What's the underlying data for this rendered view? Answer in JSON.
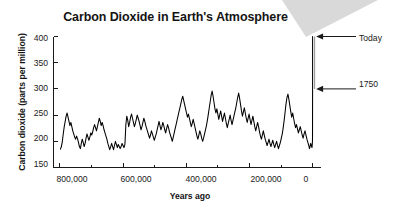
{
  "figure": {
    "background_color": "#ffffff",
    "title": "Carbon Dioxide in Earth's Atmosphere",
    "wedge_color": "#d9d9d9"
  },
  "annotations": [
    {
      "name": "today",
      "label": "Today",
      "value_ppm": 400,
      "years_ago": 0
    },
    {
      "name": "1750",
      "label": "1750",
      "value_ppm": 300,
      "years_ago": 0
    }
  ],
  "chart_data": {
    "type": "line",
    "title": "Carbon Dioxide in Earth's Atmosphere",
    "xlabel": "Years ago",
    "ylabel": "Carbon dioxide (parts per million)",
    "xlim": [
      820000,
      -25000
    ],
    "ylim": [
      150,
      400
    ],
    "x_reversed": true,
    "grid": false,
    "legend": null,
    "yticks": [
      150,
      200,
      250,
      300,
      350,
      400
    ],
    "ytick_labels": [
      "150",
      "200",
      "250",
      "300",
      "350",
      "400"
    ],
    "xticks": [
      800000,
      700000,
      600000,
      500000,
      400000,
      300000,
      200000,
      100000,
      0
    ],
    "xtick_labels": [
      "800,000",
      "",
      "600,000",
      "",
      "400,000",
      "",
      "200,000",
      "",
      "0"
    ],
    "major_xticks": [
      800000,
      600000,
      400000,
      200000,
      0
    ],
    "line_color": "#000000",
    "line_width": 1,
    "series": [
      {
        "name": "Ice core CO2 record",
        "x": [
          798000,
          795000,
          792000,
          789000,
          786000,
          783000,
          780000,
          777000,
          774000,
          771000,
          768000,
          765000,
          762000,
          759000,
          756000,
          753000,
          750000,
          747000,
          744000,
          741000,
          738000,
          735000,
          732000,
          729000,
          726000,
          723000,
          720000,
          717000,
          714000,
          711000,
          708000,
          705000,
          702000,
          699000,
          696000,
          693000,
          690000,
          687000,
          684000,
          681000,
          678000,
          675000,
          672000,
          669000,
          666000,
          663000,
          660000,
          657000,
          654000,
          651000,
          648000,
          645000,
          642000,
          639000,
          636000,
          633000,
          630000,
          627000,
          624000,
          621000,
          618000,
          615000,
          612000,
          609000,
          606000,
          603000,
          600000,
          597000,
          594000,
          591000,
          588000,
          585000,
          582000,
          579000,
          576000,
          573000,
          570000,
          567000,
          564000,
          561000,
          558000,
          555000,
          552000,
          549000,
          546000,
          543000,
          540000,
          537000,
          534000,
          531000,
          528000,
          525000,
          522000,
          519000,
          516000,
          513000,
          510000,
          507000,
          504000,
          501000,
          498000,
          495000,
          492000,
          489000,
          486000,
          483000,
          480000,
          477000,
          474000,
          471000,
          468000,
          465000,
          462000,
          459000,
          456000,
          453000,
          450000,
          447000,
          444000,
          441000,
          438000,
          435000,
          432000,
          429000,
          426000,
          423000,
          420000,
          417000,
          414000,
          411000,
          408000,
          405000,
          402000,
          399000,
          396000,
          393000,
          390000,
          387000,
          384000,
          381000,
          378000,
          375000,
          372000,
          369000,
          366000,
          363000,
          360000,
          357000,
          354000,
          351000,
          348000,
          345000,
          342000,
          339000,
          336000,
          333000,
          330000,
          327000,
          324000,
          321000,
          318000,
          315000,
          312000,
          309000,
          306000,
          303000,
          300000,
          297000,
          294000,
          291000,
          288000,
          285000,
          282000,
          279000,
          276000,
          273000,
          270000,
          267000,
          264000,
          261000,
          258000,
          255000,
          252000,
          249000,
          246000,
          243000,
          240000,
          237000,
          234000,
          231000,
          228000,
          225000,
          222000,
          219000,
          216000,
          213000,
          210000,
          207000,
          204000,
          201000,
          198000,
          195000,
          192000,
          189000,
          186000,
          183000,
          180000,
          177000,
          174000,
          171000,
          168000,
          165000,
          162000,
          159000,
          156000,
          153000,
          150000,
          147000,
          144000,
          141000,
          138000,
          135000,
          132000,
          129000,
          126000,
          123000,
          120000,
          117000,
          114000,
          111000,
          108000,
          105000,
          102000,
          99000,
          96000,
          93000,
          90000,
          87000,
          84000,
          81000,
          78000,
          75000,
          72000,
          69000,
          66000,
          63000,
          60000,
          57000,
          54000,
          51000,
          48000,
          45000,
          42000,
          39000,
          36000,
          33000,
          30000,
          27000,
          24000,
          21000,
          18000,
          15000,
          12000,
          10000,
          8000,
          6000,
          4000,
          2000,
          1000,
          500,
          260
        ],
        "y": [
          185,
          190,
          200,
          215,
          228,
          238,
          248,
          254,
          246,
          238,
          230,
          236,
          228,
          220,
          214,
          208,
          204,
          210,
          205,
          198,
          190,
          186,
          196,
          204,
          198,
          190,
          196,
          206,
          214,
          208,
          202,
          208,
          216,
          212,
          218,
          226,
          232,
          226,
          220,
          228,
          236,
          244,
          238,
          230,
          236,
          230,
          222,
          216,
          210,
          204,
          196,
          190,
          184,
          190,
          196,
          190,
          184,
          192,
          200,
          194,
          188,
          194,
          190,
          186,
          190,
          196,
          192,
          188,
          194,
          232,
          248,
          240,
          228,
          236,
          246,
          252,
          244,
          236,
          228,
          234,
          242,
          250,
          244,
          238,
          230,
          222,
          228,
          236,
          244,
          238,
          230,
          224,
          218,
          212,
          206,
          212,
          220,
          214,
          208,
          202,
          208,
          214,
          222,
          230,
          238,
          230,
          222,
          228,
          236,
          230,
          222,
          216,
          224,
          232,
          226,
          218,
          212,
          206,
          200,
          208,
          216,
          224,
          232,
          240,
          248,
          256,
          264,
          272,
          280,
          286,
          278,
          270,
          262,
          254,
          246,
          252,
          244,
          236,
          228,
          234,
          242,
          234,
          226,
          218,
          210,
          204,
          212,
          220,
          214,
          206,
          200,
          206,
          214,
          222,
          230,
          240,
          252,
          264,
          276,
          288,
          296,
          286,
          274,
          262,
          254,
          262,
          252,
          242,
          250,
          258,
          248,
          238,
          246,
          254,
          244,
          234,
          226,
          234,
          242,
          250,
          240,
          232,
          240,
          248,
          256,
          264,
          274,
          284,
          292,
          282,
          270,
          258,
          248,
          256,
          264,
          254,
          244,
          236,
          244,
          252,
          242,
          232,
          240,
          248,
          238,
          228,
          220,
          228,
          236,
          228,
          218,
          210,
          204,
          212,
          220,
          212,
          204,
          198,
          192,
          198,
          204,
          196,
          190,
          196,
          202,
          194,
          188,
          194,
          200,
          192,
          186,
          192,
          198,
          206,
          214,
          226,
          240,
          256,
          272,
          284,
          290,
          280,
          268,
          256,
          246,
          254,
          244,
          234,
          226,
          232,
          224,
          216,
          222,
          228,
          220,
          212,
          206,
          214,
          220,
          212,
          204,
          198,
          192,
          186,
          190,
          196,
          192,
          188,
          194,
          200,
          210
        ],
        "notes": "Ice-core reconstruction of atmospheric CO2 over the past ~800,000 years"
      },
      {
        "name": "Industrial-era rise",
        "x": [
          260,
          200,
          150,
          120,
          90,
          70,
          55,
          40,
          25,
          10,
          0
        ],
        "y": [
          210,
          230,
          252,
          266,
          277,
          284,
          290,
          296,
          300,
          300,
          400
        ],
        "notes": "Sharp modern spike from ~280 ppm in 1750 to ~400 ppm today"
      }
    ]
  },
  "axes": {
    "y_tick_labels": [
      "400",
      "350",
      "300",
      "250",
      "200",
      "150"
    ],
    "x_tick_labels": [
      "800,000",
      "600,000",
      "400,000",
      "200,000",
      "0"
    ],
    "x_axis_title": "Years ago",
    "y_axis_title": "Carbon dioxide (parts per million)"
  }
}
